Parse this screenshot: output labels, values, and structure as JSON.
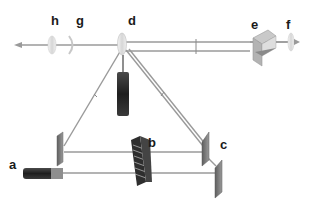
{
  "diagram": {
    "type": "optical-setup",
    "labels": {
      "a": "a",
      "b": "b",
      "c": "c",
      "d": "d",
      "e": "e",
      "f": "f",
      "g": "g",
      "h": "h"
    },
    "components": [
      {
        "id": "a",
        "kind": "laser-source"
      },
      {
        "id": "b",
        "kind": "diffraction-grating-pair"
      },
      {
        "id": "c",
        "kind": "mirror-pair"
      },
      {
        "id": "d",
        "kind": "beam-splitter-lens"
      },
      {
        "id": "e",
        "kind": "prism-retroreflector"
      },
      {
        "id": "f",
        "kind": "lens"
      },
      {
        "id": "g",
        "kind": "lens"
      },
      {
        "id": "h",
        "kind": "lens"
      }
    ],
    "colors": {
      "beam": "#9a9a9a",
      "laser_body": "#2a2a2a",
      "laser_cap": "#8a8a8a",
      "mirror": "#7d7d7d",
      "lens": "#e2e2e2",
      "label": "#1a1a1a"
    }
  }
}
